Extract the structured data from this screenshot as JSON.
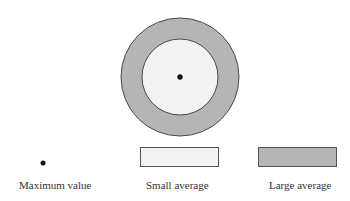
{
  "diagram": {
    "outer_circle": {
      "cx": 180,
      "cy": 77,
      "r": 59,
      "fill": "#b5b5b5",
      "stroke": "#4a4a4a"
    },
    "inner_circle": {
      "cx": 180,
      "cy": 77,
      "r": 38,
      "fill": "#f3f3f3",
      "stroke": "#4a4a4a"
    },
    "center_dot": {
      "cx": 180,
      "cy": 77,
      "r": 2.7,
      "fill": "#111111"
    }
  },
  "legend": {
    "items": [
      {
        "key": "max",
        "label": "Maximum value",
        "symbol": "dot",
        "fill": "#111111"
      },
      {
        "key": "small",
        "label": "Small average",
        "symbol": "box",
        "fill": "#f3f3f3",
        "stroke": "#555555"
      },
      {
        "key": "large",
        "label": "Large average",
        "symbol": "box",
        "fill": "#b5b5b5",
        "stroke": "#555555"
      }
    ]
  }
}
